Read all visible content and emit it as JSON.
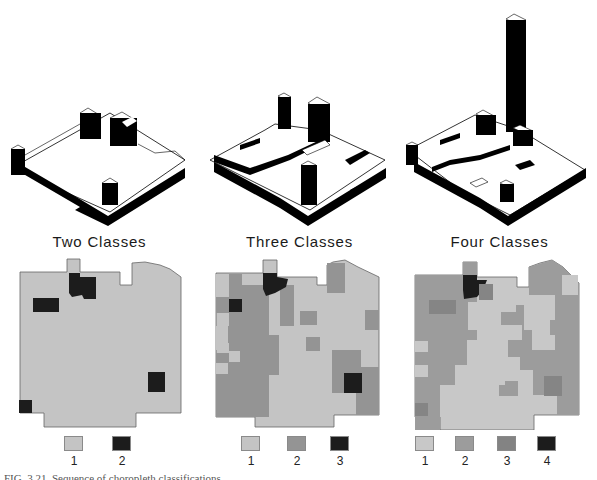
{
  "figure": {
    "caption": "FIG. 3.21. Sequence of choropleth classifications"
  },
  "colors": {
    "class_light": "#c4c4c4",
    "class_mid": "#9a9a9a",
    "class_dark_mid": "#858585",
    "class_black": "#1c1c1c",
    "outline": "#777777",
    "block_black": "#111111"
  },
  "panels": [
    {
      "title": "Two Classes",
      "legend": [
        {
          "label": "1",
          "color": "#c4c4c4"
        },
        {
          "label": "2",
          "color": "#1c1c1c"
        }
      ]
    },
    {
      "title": "Three Classes",
      "legend": [
        {
          "label": "1",
          "color": "#c4c4c4"
        },
        {
          "label": "2",
          "color": "#949494"
        },
        {
          "label": "3",
          "color": "#1c1c1c"
        }
      ]
    },
    {
      "title": "Four Classes",
      "legend": [
        {
          "label": "1",
          "color": "#c8c8c8"
        },
        {
          "label": "2",
          "color": "#9c9c9c"
        },
        {
          "label": "3",
          "color": "#838383"
        },
        {
          "label": "4",
          "color": "#1c1c1c"
        }
      ]
    }
  ]
}
